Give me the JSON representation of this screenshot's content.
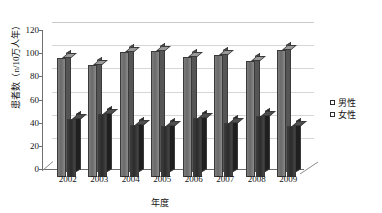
{
  "chart_data": {
    "type": "bar",
    "title": "",
    "subtitle": "",
    "xlabel": "年度",
    "ylabel": "患者数（n/10万人年）",
    "categories": [
      "2002",
      "2003",
      "2004",
      "2005",
      "2006",
      "2007",
      "2008",
      "2009"
    ],
    "series": [
      {
        "name": "男性",
        "values": [
          103,
          97,
          108,
          109,
          104,
          105,
          100,
          110
        ],
        "color": "#6e6e6e"
      },
      {
        "name": "女性",
        "values": [
          50,
          54,
          45,
          44,
          51,
          47,
          53,
          44
        ],
        "color": "#333333"
      }
    ],
    "ylim": [
      0,
      120
    ],
    "yticks": [
      0,
      20,
      40,
      60,
      80,
      100,
      120
    ],
    "ytick_labels": [
      "0",
      "20",
      "40",
      "60",
      "80",
      "100",
      "120"
    ],
    "grid": true,
    "grid_axis": "y",
    "legend_position": "right",
    "style": "3d-column"
  },
  "legend": {
    "items": [
      {
        "label": "男性",
        "color": "#6e6e6e"
      },
      {
        "label": "女性",
        "color": "#333333"
      }
    ]
  }
}
